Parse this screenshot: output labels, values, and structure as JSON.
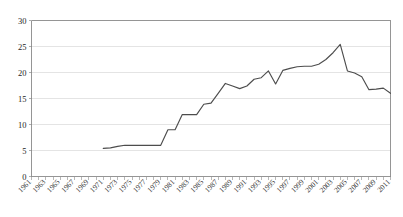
{
  "chart_data": {
    "type": "line",
    "title": "",
    "subtitle": "",
    "xlabel": "",
    "ylabel": "",
    "xlim": [
      1961,
      2011
    ],
    "ylim": [
      0,
      30
    ],
    "y_ticks": [
      0,
      5,
      10,
      15,
      20,
      25,
      30
    ],
    "x_ticks": [
      1961,
      1963,
      1965,
      1967,
      1969,
      1971,
      1973,
      1975,
      1977,
      1979,
      1981,
      1983,
      1985,
      1987,
      1989,
      1991,
      1993,
      1995,
      1997,
      1999,
      2001,
      2003,
      2005,
      2007,
      2009,
      2011
    ],
    "x_tick_rotation_deg": 45,
    "grid": "horizontal",
    "legend": "none",
    "series_color": "#4d4d4d",
    "grid_color": "#d9d9d9",
    "axis_color": "#8a8a8a",
    "series": [
      {
        "name": "series-1",
        "x": [
          1971,
          1972,
          1973,
          1974,
          1975,
          1976,
          1977,
          1978,
          1979,
          1980,
          1981,
          1982,
          1983,
          1984,
          1985,
          1986,
          1987,
          1988,
          1989,
          1990,
          1991,
          1992,
          1993,
          1994,
          1995,
          1996,
          1997,
          1998,
          1999,
          2000,
          2001,
          2002,
          2003,
          2004,
          2005,
          2006,
          2007,
          2008,
          2009,
          2010,
          2011
        ],
        "values": [
          5.4,
          5.5,
          5.8,
          6.0,
          6.0,
          6.0,
          6.0,
          6.0,
          6.0,
          9.0,
          9.0,
          11.9,
          11.9,
          11.9,
          13.9,
          14.1,
          16.0,
          17.9,
          17.4,
          16.9,
          17.4,
          18.7,
          19.0,
          20.3,
          17.8,
          20.4,
          20.8,
          21.1,
          21.2,
          21.2,
          21.6,
          22.5,
          23.8,
          25.4,
          20.3,
          19.9,
          19.2,
          16.7,
          16.8,
          17.0,
          16.0
        ]
      }
    ],
    "y_tick_labels": [
      "0",
      "5",
      "10",
      "15",
      "20",
      "25",
      "30"
    ],
    "x_tick_labels": [
      "1961",
      "1963",
      "1965",
      "1967",
      "1969",
      "1971",
      "1973",
      "1975",
      "1977",
      "1979",
      "1981",
      "1983",
      "1985",
      "1987",
      "1989",
      "1991",
      "1993",
      "1995",
      "1997",
      "1999",
      "2001",
      "2003",
      "2005",
      "2007",
      "2009",
      "2011"
    ]
  }
}
